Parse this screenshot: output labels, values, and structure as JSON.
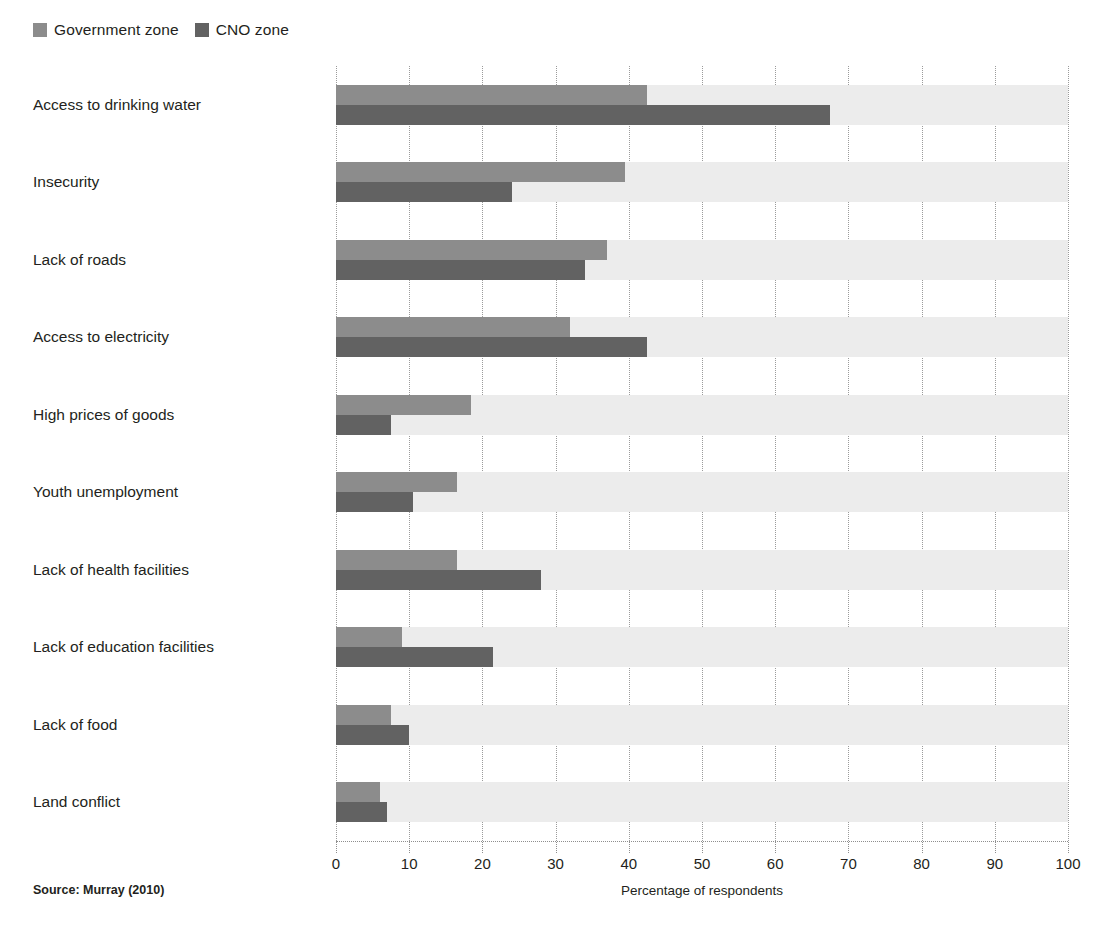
{
  "legend": {
    "items": [
      {
        "label": "Government zone",
        "color": "#8c8c8c",
        "icon": "legend-swatch-icon"
      },
      {
        "label": "CNO zone",
        "color": "#626262",
        "icon": "legend-swatch-icon"
      }
    ]
  },
  "source": {
    "text": "Source: Murray (2010)"
  },
  "chart_data": {
    "type": "bar",
    "orientation": "horizontal",
    "title": "",
    "subtitle": "",
    "xlabel": "Percentage of respondents",
    "ylabel": "",
    "xlim": [
      0,
      100
    ],
    "xticks": [
      0,
      10,
      20,
      30,
      40,
      50,
      60,
      70,
      80,
      90,
      100
    ],
    "xtick_labels": [
      "0",
      "10",
      "20",
      "30",
      "40",
      "50",
      "60",
      "70",
      "80",
      "90",
      "100"
    ],
    "grid": "vertical-dotted",
    "legend_position": "top-left",
    "categories": [
      "Access to drinking water",
      "Insecurity",
      "Lack of roads",
      "Access to electricity",
      "High prices of goods",
      "Youth unemployment",
      "Lack of health facilities",
      "Lack of education facilities",
      "Lack of food",
      "Land conflict"
    ],
    "series": [
      {
        "name": "Government zone",
        "color": "#8c8c8c",
        "values": [
          42.5,
          39.5,
          37.0,
          32.0,
          18.5,
          16.5,
          16.5,
          9.0,
          7.5,
          6.0
        ]
      },
      {
        "name": "CNO zone",
        "color": "#626262",
        "values": [
          67.5,
          24.0,
          34.0,
          42.5,
          7.5,
          10.5,
          28.0,
          21.5,
          10.0,
          7.0
        ]
      }
    ]
  }
}
